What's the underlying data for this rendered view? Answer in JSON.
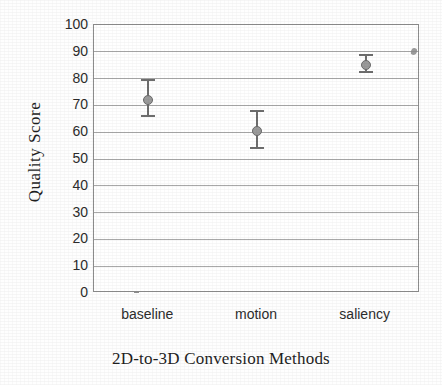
{
  "chart_data": {
    "type": "scatter",
    "title": "",
    "xlabel": "2D-to-3D Conversion Methods",
    "ylabel": "Quality Score",
    "categories": [
      "baseline",
      "motion",
      "saliency"
    ],
    "values": [
      72,
      60.5,
      85
    ],
    "error_low": [
      65.7,
      53.7,
      82
    ],
    "error_high": [
      80,
      68.3,
      89
    ],
    "error_minus": [
      6.3,
      6.8,
      3
    ],
    "error_plus": [
      8,
      7.8,
      4
    ],
    "ylim": [
      0,
      100
    ],
    "y_ticks": [
      0,
      10,
      20,
      30,
      40,
      50,
      60,
      70,
      80,
      90,
      100
    ],
    "y_tick_labels": [
      "0",
      "10",
      "20",
      "30",
      "40",
      "50",
      "60",
      "70",
      "80",
      "90",
      "100"
    ],
    "grid": true,
    "grid_axis": "y",
    "legend": "none",
    "marker": "filled-circle",
    "marker_color": "#9a9a9a",
    "errorbar_color": "#6e6e6e",
    "gridline_color": "#a9a9a9",
    "frame_color": "#8d8d8d",
    "background_color": "#ffffff",
    "text_color": "#1f1f1f",
    "series": [
      {
        "name": "Quality Score",
        "points": [
          {
            "category": "baseline",
            "value": 72,
            "low": 65.7,
            "high": 80
          },
          {
            "category": "motion",
            "value": 60.5,
            "low": 53.7,
            "high": 68.3
          },
          {
            "category": "saliency",
            "value": 85,
            "low": 82,
            "high": 89
          }
        ]
      }
    ],
    "annotations": [
      {
        "name": "scan-artifact",
        "text": "",
        "x_px": 411,
        "y_px": 48
      }
    ]
  }
}
